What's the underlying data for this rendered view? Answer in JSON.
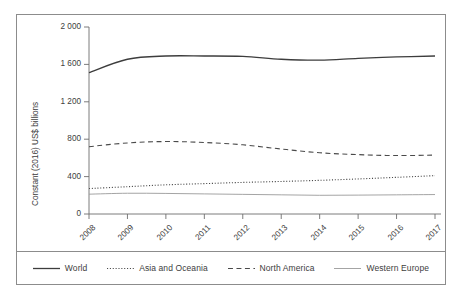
{
  "figure": {
    "background_color": "#ffffff",
    "frame_color": "#8c8c8c"
  },
  "axis": {
    "ylabel": "Constant (2016) US$ billions",
    "yticks": [
      "0",
      "400",
      "800",
      "1 200",
      "1 600",
      "2 000"
    ],
    "xticks": [
      "2008",
      "2009",
      "2010",
      "2011",
      "2012",
      "2013",
      "2014",
      "2015",
      "2016",
      "2017"
    ]
  },
  "legend": {
    "items": [
      {
        "label": "World",
        "style": "solid",
        "color": "#3d3d3d",
        "width": 1.3
      },
      {
        "label": "Asia and Oceania",
        "style": "dotted",
        "color": "#4a4a4a",
        "width": 1.1
      },
      {
        "label": "North America",
        "style": "dashed",
        "color": "#4a4a4a",
        "width": 1.1
      },
      {
        "label": "Western Europe",
        "style": "solid",
        "color": "#9a9a9a",
        "width": 0.9
      }
    ]
  },
  "chart_data": {
    "type": "line",
    "title": "",
    "xlabel": "",
    "ylabel": "Constant (2016) US$ billions",
    "x": [
      2008,
      2009,
      2010,
      2011,
      2012,
      2013,
      2014,
      2015,
      2016,
      2017
    ],
    "xlim": [
      2008,
      2017
    ],
    "ylim": [
      0,
      2000
    ],
    "ytick_values": [
      0,
      400,
      800,
      1200,
      1600,
      2000
    ],
    "grid": false,
    "legend_position": "bottom",
    "series": [
      {
        "name": "World",
        "style": "solid",
        "color": "#3d3d3d",
        "values": [
          1512,
          1655,
          1690,
          1690,
          1685,
          1655,
          1645,
          1665,
          1680,
          1690
        ]
      },
      {
        "name": "Asia and Oceania",
        "style": "dotted",
        "color": "#4a4a4a",
        "values": [
          272,
          292,
          312,
          325,
          338,
          348,
          360,
          375,
          392,
          410
        ]
      },
      {
        "name": "North America",
        "style": "dashed",
        "color": "#4a4a4a",
        "values": [
          720,
          760,
          775,
          765,
          740,
          695,
          655,
          635,
          625,
          630
        ]
      },
      {
        "name": "Western Europe",
        "style": "solid",
        "color": "#9a9a9a",
        "values": [
          212,
          222,
          220,
          215,
          210,
          205,
          200,
          202,
          205,
          208
        ]
      }
    ]
  }
}
